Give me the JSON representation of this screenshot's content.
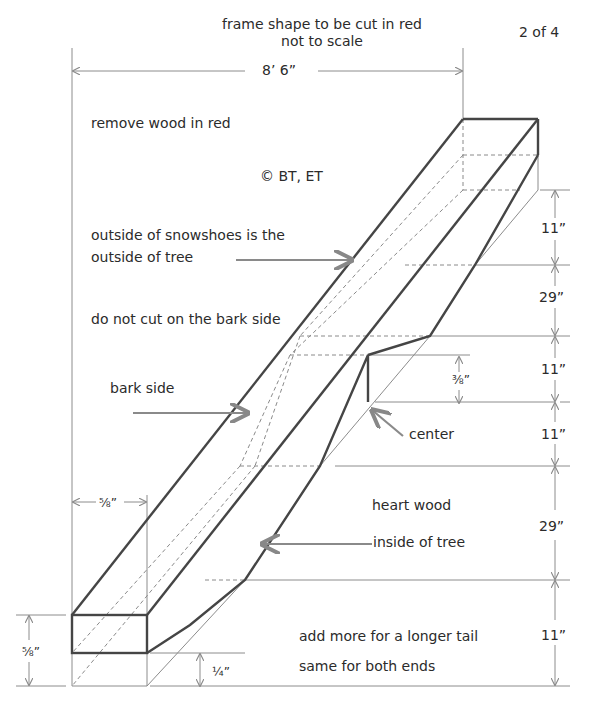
{
  "header": {
    "title_line1": "frame shape to be cut in red",
    "title_line2": "not to scale",
    "page_indicator": "2 of 4"
  },
  "dimensions": {
    "overall_length": "8’ 6”",
    "end_width": "⅝”",
    "end_height": "⅝”",
    "bottom_thickness": "¼”",
    "center_depth": "⅜”",
    "right_column": [
      "11”",
      "29”",
      "11”",
      "11”",
      "29”",
      "11”"
    ]
  },
  "annotations": {
    "remove_wood": "remove wood in red",
    "copyright": "© BT, ET",
    "outside_line1": "outside of snowshoes is the",
    "outside_line2": "outside of tree",
    "no_cut": "do not cut on the bark side",
    "bark_side": "bark side",
    "center": "center",
    "heart_wood": "heart wood",
    "inside_tree": "inside of tree",
    "tail_line1": "add more for a longer tail",
    "tail_line2": "same for both ends"
  },
  "colors": {
    "outline": "#444444",
    "dim_line": "#888888",
    "dashed": "#8a8a8a"
  }
}
